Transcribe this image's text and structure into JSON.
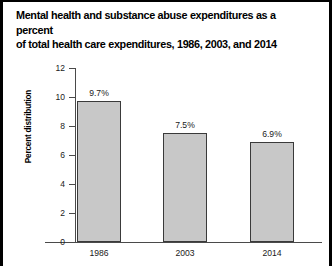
{
  "figure": {
    "title_line1": "Mental health and substance abuse expenditures as a percent",
    "title_line2": "of total health care expenditures, 1986, 2003, and 2014"
  },
  "chart_data": {
    "type": "bar",
    "title": "Mental health and substance abuse expenditures as a percent of total health care expenditures, 1986, 2003, and 2014",
    "categories": [
      "1986",
      "2003",
      "2014"
    ],
    "values": [
      9.7,
      7.5,
      6.9
    ],
    "data_labels": [
      "9.7%",
      "7.5%",
      "6.9%"
    ],
    "xlabel": "",
    "ylabel": "Percent distribution",
    "ylim": [
      0,
      12
    ],
    "yticks": [
      0,
      2,
      4,
      6,
      8,
      10,
      12
    ],
    "ytick_labels": [
      "0",
      "2",
      "4",
      "6",
      "8",
      "10",
      "12"
    ],
    "grid": false,
    "legend": "none",
    "bar_color": "#c8c8c8",
    "bar_edge_color": "#3a3a3a"
  }
}
